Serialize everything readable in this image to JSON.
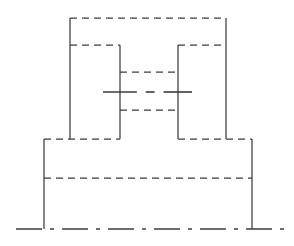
{
  "drawing": {
    "title": "Orthographic Part View",
    "view_name": "front-view",
    "canvas": {
      "width": 294,
      "height": 246,
      "background": "#ffffff"
    },
    "colors": {
      "line": "#3c3c3c",
      "background": "#ffffff"
    },
    "line_styles": {
      "hidden": {
        "name": "hidden-edge",
        "dash": "7 5",
        "width": 1.25
      },
      "center": {
        "name": "center-line",
        "dash": "none",
        "width": 1.6
      },
      "solid": {
        "name": "solid-edge",
        "dash": "none",
        "width": 1.25
      }
    },
    "geometry": {
      "upper_block": {
        "label": "upper-block",
        "left": 70,
        "right": 226,
        "top": 18,
        "bottom": 139
      },
      "shoulder_step": {
        "label": "shoulder-step",
        "y": 45,
        "left_span": [
          70,
          120
        ],
        "right_span": [
          178,
          226
        ]
      },
      "slot": {
        "label": "center-slot",
        "left": 120,
        "right": 178,
        "top": 72,
        "bottom": 110
      },
      "base_block": {
        "label": "base-block",
        "left": 44,
        "right": 252,
        "top": 139,
        "bottom": 229
      },
      "base_internal_line": {
        "label": "base-internal-edge",
        "y": 178,
        "left": 44,
        "right": 252
      },
      "horizontal_centerline": {
        "label": "horizontal-centerline",
        "y": 92,
        "left": 103,
        "right": 192
      },
      "bottom_centerline": {
        "label": "bottom-centerline",
        "y": 229,
        "left": 16,
        "right": 285
      },
      "left_post": {
        "label": "left-post",
        "x": 44,
        "top": 139,
        "bottom": 229
      },
      "right_post": {
        "label": "right-post",
        "x": 252,
        "top": 139,
        "bottom": 229
      },
      "upper_left_wall": {
        "label": "upper-left-wall",
        "x": 70,
        "top": 18,
        "bottom": 45
      },
      "upper_right_wall": {
        "label": "upper-right-wall",
        "x": 226,
        "top": 18,
        "bottom": 45
      },
      "inner_left_wall": {
        "label": "inner-left-wall",
        "x": 120,
        "top": 45,
        "bottom": 139
      },
      "inner_right_wall": {
        "label": "inner-right-wall",
        "x": 178,
        "top": 45,
        "bottom": 139
      },
      "lower_left_wall": {
        "label": "lower-left-wall",
        "x": 70,
        "top": 45,
        "bottom": 139
      },
      "lower_right_wall": {
        "label": "lower-right-wall",
        "x": 226,
        "top": 45,
        "bottom": 139
      }
    },
    "paths": {
      "top_edge": "M 70 18 L 226 18",
      "upper_left_wall": "M 70 18 L 70 139",
      "upper_right_wall": "M 226 18 L 226 139",
      "shoulder_left": "M 70 45 L 120 45",
      "shoulder_right": "M 178 45 L 226 45",
      "inner_left_wall": "M 120 45 L 120 139",
      "inner_right_wall": "M 178 45 L 178 139",
      "slot_top": "M 120 72 L 178 72",
      "slot_bottom": "M 120 110 L 178 110",
      "base_top_left": "M 44 139 L 120 139",
      "base_top_mid": "M 120 139 L 178 139",
      "base_top_right": "M 178 139 L 252 139",
      "base_left_wall": "M 44 139 L 44 229",
      "base_right_wall": "M 252 139 L 252 229",
      "base_internal": "M 44 178 L 252 178",
      "horizontal_centerline": "M 103 92 L 192 92",
      "bottom_centerline": "M 16 229 L 285 229"
    }
  }
}
